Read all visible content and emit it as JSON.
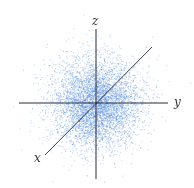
{
  "figure": {
    "title": "",
    "background": "#ffffff",
    "point_color": "#3a78d8",
    "axis_color": "#2a2a3a",
    "center": [
      96,
      103
    ],
    "point_count": 5000,
    "spread_px": 22
  },
  "axes": {
    "x": {
      "label": "x",
      "from": [
        45,
        155
      ],
      "to": [
        152,
        47
      ],
      "label_pos": [
        34,
        152
      ]
    },
    "y": {
      "label": "y",
      "from": [
        19,
        103
      ],
      "to": [
        168,
        103
      ],
      "label_pos": [
        174,
        96
      ]
    },
    "z": {
      "label": "z",
      "from": [
        96,
        29
      ],
      "to": [
        96,
        179
      ],
      "label_pos": [
        92,
        15
      ]
    }
  },
  "chart_data": {
    "type": "scatter",
    "title": "",
    "dimensions": 3,
    "axis_labels": [
      "x",
      "y",
      "z"
    ],
    "distribution": "gaussian",
    "mean": [
      0,
      0,
      0
    ],
    "std": [
      1,
      1,
      1
    ],
    "grid": false,
    "legend": null
  }
}
